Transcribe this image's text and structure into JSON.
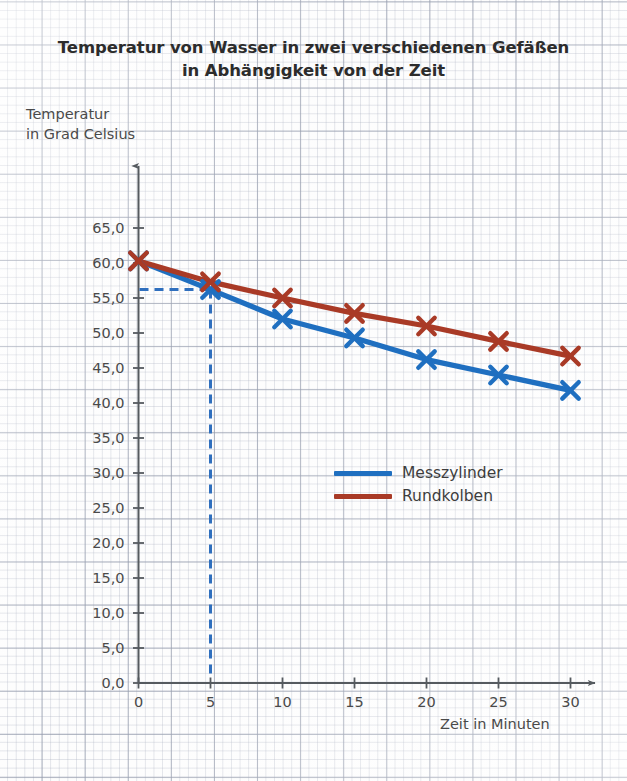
{
  "title": {
    "line1": "Temperatur von Wasser in zwei verschiedenen Gefäßen",
    "line2": "in Abhängigkeit von der Zeit"
  },
  "axis_titles": {
    "y": "Temperatur\nin Grad Celsius",
    "x": "Zeit in Minuten"
  },
  "legend": {
    "items": [
      {
        "label": "Messzylinder",
        "color": "#1f6fc0"
      },
      {
        "label": "Rundkolben",
        "color": "#a93a26"
      }
    ]
  },
  "chart_data": {
    "type": "line",
    "title": "Temperatur von Wasser in zwei verschiedenen Gefäßen in Abhängigkeit von der Zeit",
    "xlabel": "Zeit in Minuten",
    "ylabel": "Temperatur in Grad Celsius",
    "x": [
      0,
      5,
      10,
      15,
      20,
      25,
      30
    ],
    "xlim": [
      0,
      30
    ],
    "ylim": [
      0,
      65
    ],
    "xticks": [
      0,
      5,
      10,
      15,
      20,
      25,
      30
    ],
    "xtick_labels": [
      "0",
      "5",
      "10",
      "15",
      "20",
      "25",
      "30"
    ],
    "yticks": [
      0,
      5,
      10,
      15,
      20,
      25,
      30,
      35,
      40,
      45,
      50,
      55,
      60,
      65
    ],
    "ytick_labels": [
      "0,0",
      "5,0",
      "10,0",
      "15,0",
      "20,0",
      "25,0",
      "30,0",
      "35,0",
      "40,0",
      "45,0",
      "50,0",
      "55,0",
      "60,0",
      "65,0"
    ],
    "grid": true,
    "legend_position": "center-right",
    "marker": "x",
    "series": [
      {
        "name": "Messzylinder",
        "color": "#1f6fc0",
        "values": [
          60.3,
          56.2,
          52.0,
          49.3,
          46.2,
          44.0,
          41.8
        ]
      },
      {
        "name": "Rundkolben",
        "color": "#a93a26",
        "values": [
          60.3,
          57.3,
          55.0,
          52.8,
          51.0,
          48.8,
          46.7
        ]
      }
    ],
    "annotations": [
      {
        "type": "construction-line",
        "style": "dashed",
        "color": "#2f6fbe",
        "description": "Ablesehilfe bei t = 5 min auf die Messzylinder-Kurve",
        "x": 5,
        "y": 56.2
      }
    ]
  }
}
